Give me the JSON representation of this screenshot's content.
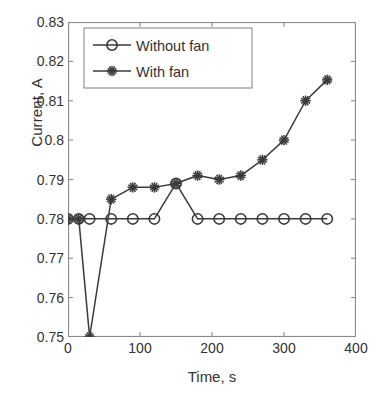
{
  "chart_data": {
    "type": "line",
    "title": "",
    "xlabel": "Time, s",
    "ylabel": "Current, A",
    "xlim": [
      0,
      400
    ],
    "ylim": [
      0.75,
      0.83
    ],
    "xticks": [
      0,
      100,
      200,
      300,
      400
    ],
    "xtick_labels": [
      "0",
      "100",
      "200",
      "300",
      "400"
    ],
    "yticks": [
      0.75,
      0.76,
      0.77,
      0.78,
      0.79,
      0.8,
      0.81,
      0.82,
      0.83
    ],
    "ytick_labels": [
      "0.75",
      "0.76",
      "0.77",
      "0.78",
      "0.79",
      "0.8",
      "0.81",
      "0.82",
      "0.83"
    ],
    "grid": false,
    "legend_position": "top-left",
    "series": [
      {
        "name": "Without fan",
        "marker": "circle",
        "color": "#3a3a3a",
        "x": [
          0,
          15,
          30,
          60,
          90,
          120,
          150,
          180,
          210,
          240,
          270,
          300,
          330,
          360
        ],
        "values": [
          0.78,
          0.78,
          0.78,
          0.78,
          0.78,
          0.78,
          0.789,
          0.78,
          0.78,
          0.78,
          0.78,
          0.78,
          0.78,
          0.78
        ]
      },
      {
        "name": "With fan",
        "marker": "asterisk",
        "color": "#3a3a3a",
        "x": [
          0,
          15,
          30,
          60,
          90,
          120,
          150,
          180,
          210,
          240,
          270,
          300,
          330,
          360
        ],
        "values": [
          0.78,
          0.78,
          0.75,
          0.785,
          0.788,
          0.788,
          0.789,
          0.791,
          0.79,
          0.791,
          0.795,
          0.8,
          0.81,
          0.8153
        ]
      }
    ]
  },
  "legend": {
    "entries": [
      {
        "label": "Without fan",
        "marker": "circle"
      },
      {
        "label": "With fan",
        "marker": "asterisk"
      }
    ]
  }
}
